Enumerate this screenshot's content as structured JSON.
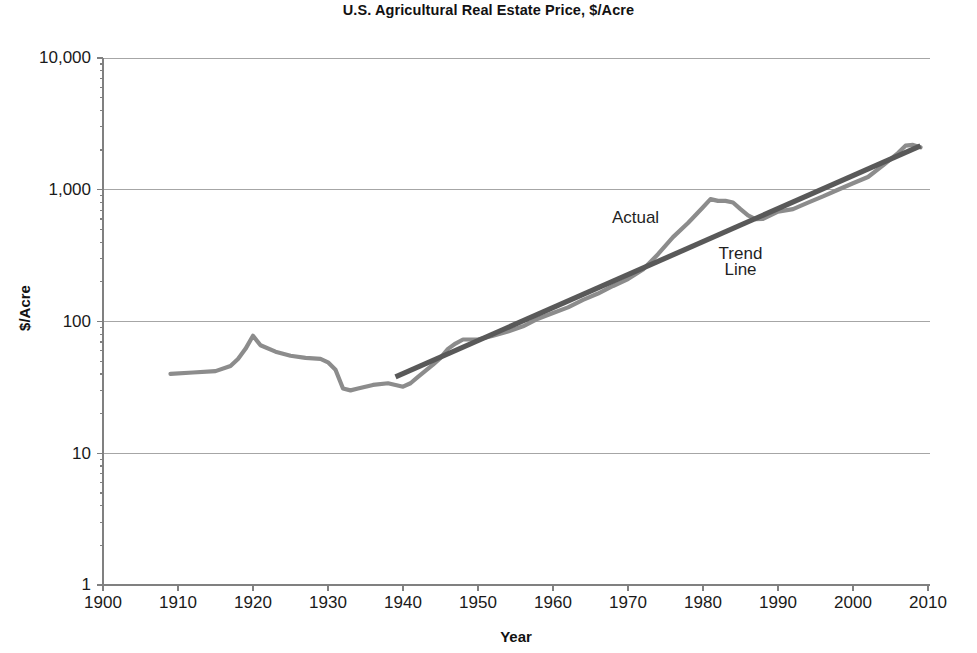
{
  "chart_data": {
    "type": "line",
    "title": "U.S. Agricultural Real Estate Price, $/Acre",
    "xlabel": "Year",
    "ylabel": "$/Acre",
    "yscale": "log",
    "ylim": [
      1,
      10000
    ],
    "xlim": [
      1900,
      2010
    ],
    "grid": "horizontal",
    "legend_position": "inline-annotations",
    "ytick_labels": [
      "1",
      "10",
      "100",
      "1,000",
      "10,000"
    ],
    "ytick_values": [
      1,
      10,
      100,
      1000,
      10000
    ],
    "xtick_labels": [
      "1900",
      "1910",
      "1920",
      "1930",
      "1940",
      "1950",
      "1960",
      "1970",
      "1980",
      "1990",
      "2000",
      "2010"
    ],
    "xtick_values": [
      1900,
      1910,
      1920,
      1930,
      1940,
      1950,
      1960,
      1970,
      1980,
      1990,
      2000,
      2010
    ],
    "annotations": [
      {
        "text": "Actual",
        "x": 1971,
        "y": 560
      },
      {
        "text": "Trend",
        "x": 1985,
        "y": 300
      },
      {
        "text": "Line",
        "x": 1985,
        "y": 225
      }
    ],
    "series": [
      {
        "name": "Actual",
        "color": "#8c8c8c",
        "x": [
          1909,
          1912,
          1915,
          1917,
          1918,
          1919,
          1920,
          1921,
          1923,
          1925,
          1927,
          1929,
          1930,
          1931,
          1932,
          1933,
          1934,
          1936,
          1938,
          1939,
          1940,
          1941,
          1942,
          1944,
          1945,
          1946,
          1947,
          1948,
          1950,
          1952,
          1954,
          1956,
          1958,
          1960,
          1962,
          1964,
          1966,
          1968,
          1970,
          1972,
          1974,
          1976,
          1978,
          1980,
          1981,
          1982,
          1983,
          1984,
          1985,
          1986,
          1987,
          1988,
          1990,
          1992,
          1994,
          1996,
          1998,
          2000,
          2002,
          2004,
          2006,
          2007,
          2008,
          2009
        ],
        "values": [
          40,
          41,
          42,
          46,
          52,
          62,
          78,
          66,
          59,
          55,
          53,
          52,
          49,
          43,
          31,
          30,
          31,
          33,
          34,
          33,
          32,
          34,
          38,
          47,
          53,
          62,
          68,
          73,
          73,
          78,
          84,
          92,
          105,
          116,
          128,
          146,
          163,
          186,
          210,
          248,
          324,
          437,
          560,
          737,
          849,
          823,
          823,
          801,
          713,
          640,
          599,
          600,
          683,
          713,
          798,
          890,
          1000,
          1120,
          1250,
          1530,
          1900,
          2160,
          2190,
          2100
        ]
      },
      {
        "name": "Trend Line",
        "color": "#595959",
        "x": [
          1939,
          2009
        ],
        "values": [
          38,
          2150
        ]
      }
    ]
  },
  "labels": {
    "title": "U.S. Agricultural Real Estate Price, $/Acre",
    "xlabel": "Year",
    "ylabel": "$/Acre"
  }
}
